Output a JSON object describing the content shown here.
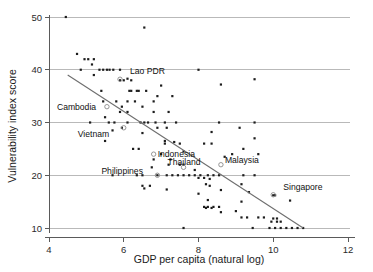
{
  "chart_data": {
    "type": "scatter",
    "title": "",
    "xlabel": "GDP per capita (natural log)",
    "ylabel": "Vulnerability index score",
    "xlim": [
      4,
      12
    ],
    "ylim": [
      9,
      50
    ],
    "xticks": [
      4,
      6,
      8,
      10,
      12
    ],
    "yticks": [
      10,
      20,
      30,
      40,
      50
    ],
    "xtick_labels": [
      "4",
      "6",
      "8",
      "10",
      "12"
    ],
    "ytick_labels": [
      "10",
      "20",
      "30",
      "40",
      "50"
    ],
    "grid": "horizontal",
    "legend": "none",
    "trendline": {
      "type": "linear-fit",
      "x_start": 4.5,
      "y_start": 39.0,
      "x_end": 10.8,
      "y_end": 10.0
    },
    "points": [
      [
        4.45,
        50.0
      ],
      [
        6.55,
        48.0
      ],
      [
        4.75,
        43.0
      ],
      [
        4.95,
        42.0
      ],
      [
        5.05,
        42.0
      ],
      [
        5.2,
        42.0
      ],
      [
        5.15,
        41.0
      ],
      [
        4.85,
        40.0
      ],
      [
        5.35,
        40.0
      ],
      [
        5.45,
        40.0
      ],
      [
        5.55,
        40.0
      ],
      [
        5.62,
        40.0
      ],
      [
        5.72,
        40.0
      ],
      [
        5.9,
        40.0
      ],
      [
        8.0,
        40.0
      ],
      [
        5.2,
        39.0
      ],
      [
        6.1,
        38.3
      ],
      [
        6.2,
        38.0
      ],
      [
        9.5,
        38.2
      ],
      [
        5.9,
        38.0
      ],
      [
        6.0,
        38.0
      ],
      [
        8.6,
        37.2
      ],
      [
        7.0,
        37.0
      ],
      [
        5.4,
        36.0
      ],
      [
        6.2,
        36.0
      ],
      [
        6.4,
        36.0
      ],
      [
        6.6,
        36.0
      ],
      [
        6.15,
        36.0
      ],
      [
        6.35,
        36.0
      ],
      [
        6.9,
        35.0
      ],
      [
        7.3,
        35.0
      ],
      [
        5.45,
        34.0
      ],
      [
        5.8,
        34.0
      ],
      [
        6.1,
        34.0
      ],
      [
        6.3,
        34.0
      ],
      [
        6.8,
        34.0
      ],
      [
        5.95,
        33.0
      ],
      [
        6.5,
        33.0
      ],
      [
        5.9,
        32.0
      ],
      [
        6.1,
        32.0
      ],
      [
        6.8,
        32.0
      ],
      [
        7.2,
        32.0
      ],
      [
        5.5,
        31.0
      ],
      [
        5.1,
        30.0
      ],
      [
        5.6,
        30.0
      ],
      [
        5.75,
        30.0
      ],
      [
        6.1,
        30.0
      ],
      [
        6.45,
        30.0
      ],
      [
        6.55,
        30.0
      ],
      [
        6.65,
        30.0
      ],
      [
        6.85,
        30.0
      ],
      [
        7.1,
        30.0
      ],
      [
        7.4,
        30.0
      ],
      [
        8.55,
        30.0
      ],
      [
        9.5,
        30.0
      ],
      [
        5.95,
        29.0
      ],
      [
        6.9,
        29.0
      ],
      [
        7.15,
        29.0
      ],
      [
        9.1,
        29.0
      ],
      [
        5.7,
        28.5
      ],
      [
        6.5,
        28.0
      ],
      [
        8.35,
        28.2
      ],
      [
        5.5,
        26.5
      ],
      [
        7.1,
        26.5
      ],
      [
        7.35,
        26.3
      ],
      [
        7.5,
        26.0
      ],
      [
        8.15,
        26.0
      ],
      [
        8.35,
        26.0
      ],
      [
        7.1,
        26.0
      ],
      [
        9.5,
        27.0
      ],
      [
        6.25,
        25.0
      ],
      [
        6.4,
        25.0
      ],
      [
        7.6,
        24.5
      ],
      [
        9.2,
        25.0
      ],
      [
        7.0,
        24.0
      ],
      [
        8.9,
        24.0
      ],
      [
        9.6,
        24.0
      ],
      [
        6.8,
        23.0
      ],
      [
        7.25,
        23.0
      ],
      [
        8.7,
        23.5
      ],
      [
        7.2,
        22.0
      ],
      [
        7.5,
        22.0
      ],
      [
        7.6,
        22.0
      ],
      [
        6.75,
        21.5
      ],
      [
        7.9,
        21.0
      ],
      [
        5.7,
        20.0
      ],
      [
        6.35,
        20.0
      ],
      [
        6.5,
        20.0
      ],
      [
        6.9,
        20.0
      ],
      [
        7.15,
        20.0
      ],
      [
        7.3,
        20.0
      ],
      [
        7.45,
        20.0
      ],
      [
        7.6,
        20.0
      ],
      [
        7.75,
        20.0
      ],
      [
        7.9,
        20.0
      ],
      [
        8.05,
        20.0
      ],
      [
        8.25,
        20.0
      ],
      [
        8.4,
        20.0
      ],
      [
        8.55,
        20.0
      ],
      [
        9.2,
        20.0
      ],
      [
        9.5,
        20.0
      ],
      [
        8.0,
        19.5
      ],
      [
        8.15,
        19.5
      ],
      [
        8.3,
        19.3
      ],
      [
        6.5,
        18.0
      ],
      [
        6.7,
        18.0
      ],
      [
        8.2,
        18.3
      ],
      [
        8.3,
        18.0
      ],
      [
        9.15,
        18.3
      ],
      [
        6.55,
        17.5
      ],
      [
        7.15,
        17.3
      ],
      [
        8.6,
        17.2
      ],
      [
        8.0,
        16.5
      ],
      [
        9.35,
        16.8
      ],
      [
        10.0,
        16.2
      ],
      [
        10.05,
        16.2
      ],
      [
        8.25,
        15.3
      ],
      [
        9.15,
        15.0
      ],
      [
        10.45,
        15.2
      ],
      [
        8.15,
        14.0
      ],
      [
        8.25,
        14.0
      ],
      [
        8.4,
        14.0
      ],
      [
        8.55,
        14.0
      ],
      [
        8.2,
        13.8
      ],
      [
        8.35,
        13.8
      ],
      [
        8.6,
        13.0
      ],
      [
        9.0,
        13.2
      ],
      [
        9.15,
        12.0
      ],
      [
        9.3,
        12.0
      ],
      [
        9.6,
        12.0
      ],
      [
        9.75,
        12.0
      ],
      [
        10.0,
        11.8
      ],
      [
        10.1,
        11.8
      ],
      [
        9.95,
        11.2
      ],
      [
        10.1,
        11.2
      ],
      [
        10.2,
        11.2
      ],
      [
        7.6,
        10.0
      ],
      [
        9.45,
        10.0
      ],
      [
        9.9,
        10.0
      ],
      [
        10.05,
        10.0
      ],
      [
        10.2,
        10.0
      ],
      [
        10.35,
        10.0
      ],
      [
        10.5,
        10.0
      ],
      [
        10.65,
        10.0
      ],
      [
        10.8,
        10.0
      ]
    ],
    "labeled_countries": [
      {
        "name": "Lao PDR",
        "x": 5.9,
        "y": 38.2,
        "label_dx": 10,
        "label_dy": -5
      },
      {
        "name": "Cambodia",
        "x": 5.55,
        "y": 33.0,
        "label_dx": -50,
        "label_dy": 3
      },
      {
        "name": "Vietnam",
        "x": 6.0,
        "y": 29.0,
        "label_dx": -46,
        "label_dy": 9
      },
      {
        "name": "Indonesia",
        "x": 6.8,
        "y": 24.0,
        "label_dx": 4,
        "label_dy": 3
      },
      {
        "name": "Philippines",
        "x": 6.9,
        "y": 20.0,
        "label_dx": -56,
        "label_dy": -1
      },
      {
        "name": "Thailand",
        "x": 7.6,
        "y": 21.5,
        "label_dx": -16,
        "label_dy": -2
      },
      {
        "name": "Malaysia",
        "x": 8.6,
        "y": 22.0,
        "label_dx": 4,
        "label_dy": -2
      },
      {
        "name": "Singapore",
        "x": 10.0,
        "y": 16.3,
        "label_dx": 10,
        "label_dy": -5
      }
    ]
  }
}
